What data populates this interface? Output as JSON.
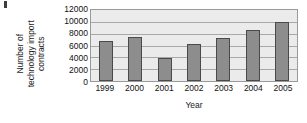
{
  "chart_data": {
    "type": "bar",
    "title": "",
    "xlabel": "Year",
    "ylabel_lines": [
      "Number of",
      "technology import",
      "contracts"
    ],
    "ylabel": "Number of technology import contracts",
    "categories": [
      "1999",
      "2000",
      "2001",
      "2002",
      "2003",
      "2004",
      "2005"
    ],
    "values": [
      6800,
      7400,
      3950,
      6200,
      7300,
      8700,
      10000
    ],
    "ylim": [
      0,
      12000
    ],
    "yticks": [
      0,
      2000,
      4000,
      6000,
      8000,
      10000,
      12000
    ],
    "ytick_labels": [
      "0",
      "2000",
      "4000",
      "6000",
      "8000",
      "10000",
      "12000"
    ],
    "grid": true,
    "legend": "none",
    "colors": {
      "bar_fill": "#8d8d8d",
      "bar_edge": "#4a4a4a",
      "plot_background": "#ebebeb",
      "gridline": "#a8a8a8",
      "axis_border": "#9a9a9a",
      "text": "#121212"
    }
  }
}
